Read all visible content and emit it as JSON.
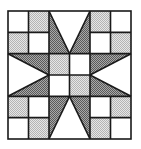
{
  "diagram": {
    "type": "quilt-block",
    "grid": {
      "rows": 6,
      "cols": 6
    },
    "bounds": {
      "x0": 8,
      "y0": 11,
      "x1": 131,
      "y1": 139
    },
    "colors": {
      "white": "#ffffff",
      "light": "#cfcfcf",
      "dark": "#7f7f7f",
      "line": "#1a1a1a"
    },
    "squares": [
      {
        "r": 0,
        "c": 0,
        "fill": "white"
      },
      {
        "r": 0,
        "c": 1,
        "fill": "light"
      },
      {
        "r": 1,
        "c": 0,
        "fill": "light"
      },
      {
        "r": 1,
        "c": 1,
        "fill": "white"
      },
      {
        "r": 0,
        "c": 4,
        "fill": "light"
      },
      {
        "r": 0,
        "c": 5,
        "fill": "white"
      },
      {
        "r": 1,
        "c": 4,
        "fill": "white"
      },
      {
        "r": 1,
        "c": 5,
        "fill": "light"
      },
      {
        "r": 4,
        "c": 0,
        "fill": "light"
      },
      {
        "r": 4,
        "c": 1,
        "fill": "white"
      },
      {
        "r": 5,
        "c": 0,
        "fill": "white"
      },
      {
        "r": 5,
        "c": 1,
        "fill": "light"
      },
      {
        "r": 4,
        "c": 4,
        "fill": "white"
      },
      {
        "r": 4,
        "c": 5,
        "fill": "light"
      },
      {
        "r": 5,
        "c": 4,
        "fill": "light"
      },
      {
        "r": 5,
        "c": 5,
        "fill": "white"
      },
      {
        "r": 2,
        "c": 2,
        "fill": "light"
      },
      {
        "r": 2,
        "c": 3,
        "fill": "white"
      },
      {
        "r": 3,
        "c": 2,
        "fill": "white"
      },
      {
        "r": 3,
        "c": 3,
        "fill": "light"
      }
    ],
    "star_points": [
      {
        "name": "top-left-point",
        "pts": [
          [
            2,
            0
          ],
          [
            2,
            2
          ],
          [
            3,
            2
          ]
        ]
      },
      {
        "name": "top-right-point",
        "pts": [
          [
            4,
            0
          ],
          [
            4,
            2
          ],
          [
            3,
            2
          ]
        ]
      },
      {
        "name": "bottom-left-point",
        "pts": [
          [
            2,
            6
          ],
          [
            2,
            4
          ],
          [
            3,
            4
          ]
        ]
      },
      {
        "name": "bottom-right-point",
        "pts": [
          [
            4,
            6
          ],
          [
            4,
            4
          ],
          [
            3,
            4
          ]
        ]
      },
      {
        "name": "left-top-point",
        "pts": [
          [
            0,
            2
          ],
          [
            2,
            2
          ],
          [
            2,
            3
          ]
        ]
      },
      {
        "name": "left-bottom-point",
        "pts": [
          [
            0,
            4
          ],
          [
            2,
            4
          ],
          [
            2,
            3
          ]
        ]
      },
      {
        "name": "right-top-point",
        "pts": [
          [
            6,
            2
          ],
          [
            4,
            2
          ],
          [
            4,
            3
          ]
        ]
      },
      {
        "name": "right-bottom-point",
        "pts": [
          [
            6,
            4
          ],
          [
            4,
            4
          ],
          [
            4,
            3
          ]
        ]
      }
    ]
  }
}
